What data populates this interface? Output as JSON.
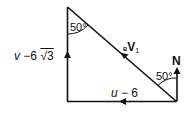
{
  "diagram": {
    "type": "vector-triangle",
    "labels": {
      "vertical_side": "v − 6 √3",
      "vertical_side_parts": {
        "v": "v",
        "minus": "−6",
        "root": "√3"
      },
      "horizontal_side": "u − 6",
      "horizontal_side_parts": {
        "u": "u",
        "rest": "− 6"
      },
      "hypotenuse_prefix": "B",
      "hypotenuse_main": "V",
      "hypotenuse_sub": "1",
      "top_angle": "50°",
      "bottom_right_angle": "50°",
      "north": "N"
    },
    "colors": {
      "line": "#111111",
      "background": "#ffffff"
    }
  }
}
